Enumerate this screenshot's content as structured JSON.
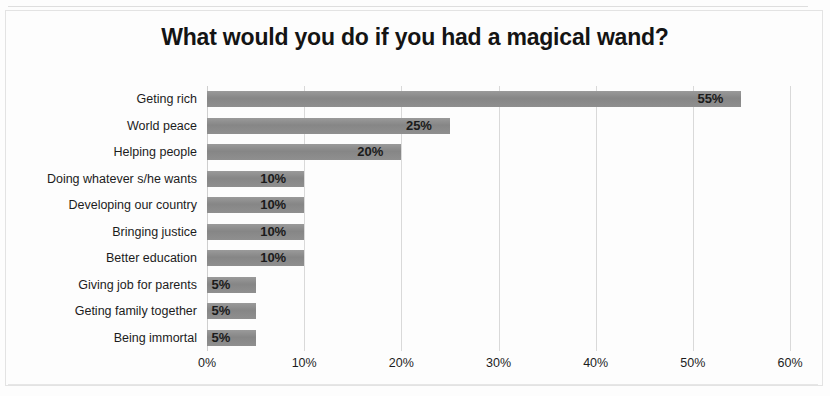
{
  "chart_data": {
    "type": "bar",
    "orientation": "horizontal",
    "title": "What would you do if you had a magical wand?",
    "xlabel": "",
    "ylabel": "",
    "xlim": [
      0,
      60
    ],
    "grid": true,
    "legend": false,
    "bar_color": "#8c8c8c",
    "text_color": "#1c1c1c",
    "gridline_color": "#d9d9d9",
    "categories": [
      "Geting rich",
      "World peace",
      "Helping people",
      "Doing whatever s/he wants",
      "Developing our country",
      "Bringing justice",
      "Better education",
      "Giving job for parents",
      "Geting family together",
      "Being immortal"
    ],
    "values": [
      55,
      25,
      20,
      10,
      10,
      10,
      10,
      5,
      5,
      5
    ],
    "data_labels": [
      "55%",
      "25%",
      "20%",
      "10%",
      "10%",
      "10%",
      "10%",
      "5%",
      "5%",
      "5%"
    ],
    "xticks": [
      0,
      10,
      20,
      30,
      40,
      50,
      60
    ],
    "xtick_labels": [
      "0%",
      "10%",
      "20%",
      "30%",
      "40%",
      "50%",
      "60%"
    ]
  }
}
